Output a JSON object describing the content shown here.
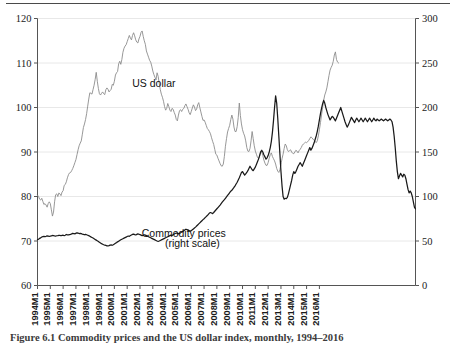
{
  "figure": {
    "caption": "Figure 6.1  Commodity prices and the US dollar index, monthly, 1994–2016",
    "top_rule": true
  },
  "chart_data": {
    "type": "line",
    "title": "",
    "subtitle": "",
    "xlabel": "",
    "ylabel": "",
    "grid": true,
    "grid_color": "#e8e8e8",
    "legend": "inline-annotations",
    "x_tick_labels": [
      "1994M1",
      "1995M1",
      "1996M1",
      "1997M1",
      "1998M1",
      "1999M1",
      "2000M1",
      "2001M1",
      "2002M1",
      "2003M1",
      "2004M1",
      "2005M1",
      "2006M1",
      "2007M1",
      "2008M1",
      "2009M1",
      "2010M1",
      "2011M1",
      "2012M1",
      "2013M1",
      "2014M1",
      "2015M1",
      "2016M1"
    ],
    "x_range": [
      "1994M1",
      "2016M7"
    ],
    "left_axis": {
      "name": "US dollar",
      "ticks": [
        60,
        70,
        80,
        90,
        100,
        110,
        120
      ],
      "ylim": [
        60,
        120
      ],
      "tick_labels": [
        "60",
        "70",
        "80",
        "90",
        "100",
        "110",
        "120"
      ]
    },
    "right_axis": {
      "name": "Commodity prices (right scale)",
      "ticks": [
        0,
        50,
        100,
        150,
        200,
        250,
        300
      ],
      "ylim": [
        0,
        300
      ],
      "tick_labels": [
        "0",
        "50",
        "100",
        "150",
        "200",
        "250",
        "300"
      ]
    },
    "annotations": [
      {
        "text": "US dollar",
        "x_approx": "2003M2",
        "y_left_approx": 104.5
      },
      {
        "text": "Commodity prices",
        "x_approx": "2005M6",
        "y_left_approx": 71.0
      },
      {
        "text": "(right scale)",
        "x_approx": "2006M2",
        "y_left_approx": 68.6
      }
    ],
    "series": [
      {
        "name": "US dollar",
        "axis": "left",
        "color": "#8c8c8c",
        "width": 0.9,
        "values": [
          80.3,
          80.0,
          79.4,
          79.2,
          79.6,
          78.9,
          78.2,
          78.4,
          78.1,
          77.6,
          78.4,
          78.8,
          78.4,
          77.0,
          75.6,
          76.5,
          78.8,
          80.4,
          80.6,
          80.0,
          80.8,
          80.6,
          80.2,
          81.0,
          81.3,
          82.5,
          82.7,
          83.3,
          84.2,
          84.9,
          85.3,
          85.4,
          85.8,
          86.3,
          86.9,
          87.6,
          88.3,
          89.4,
          90.5,
          91.4,
          92.0,
          92.5,
          94.0,
          95.5,
          96.3,
          97.3,
          98.6,
          100.3,
          101.9,
          103.3,
          103.2,
          103.0,
          104.0,
          105.0,
          106.3,
          107.9,
          105.9,
          104.3,
          103.1,
          102.8,
          103.2,
          103.5,
          103.1,
          102.9,
          104.0,
          104.4,
          104.1,
          103.5,
          103.8,
          104.1,
          105.2,
          105.0,
          105.9,
          107.3,
          107.8,
          108.1,
          109.8,
          110.4,
          109.7,
          110.8,
          112.4,
          113.3,
          113.8,
          114.1,
          114.8,
          115.5,
          116.2,
          115.6,
          115.2,
          116.2,
          116.8,
          116.1,
          115.2,
          114.7,
          114.5,
          115.4,
          116.0,
          116.9,
          117.2,
          116.0,
          115.0,
          114.2,
          112.7,
          112.0,
          111.3,
          110.6,
          110.2,
          109.3,
          108.2,
          107.4,
          106.8,
          106.2,
          107.8,
          107.0,
          105.4,
          104.0,
          103.0,
          102.3,
          101.4,
          100.2,
          99.4,
          99.8,
          100.9,
          100.2,
          99.4,
          99.1,
          99.8,
          99.6,
          98.9,
          98.3,
          97.3,
          97.0,
          98.3,
          99.3,
          99.5,
          99.1,
          99.6,
          99.8,
          100.4,
          100.8,
          100.2,
          99.6,
          98.8,
          98.4,
          99.1,
          99.9,
          100.6,
          100.1,
          99.3,
          99.6,
          100.6,
          101.1,
          100.0,
          99.0,
          98.0,
          97.1,
          97.2,
          96.7,
          96.0,
          95.3,
          95.0,
          94.6,
          94.1,
          93.2,
          92.4,
          91.7,
          90.6,
          89.5,
          89.3,
          88.6,
          88.0,
          87.4,
          86.9,
          86.8,
          87.3,
          89.0,
          91.3,
          93.0,
          94.5,
          95.3,
          96.0,
          97.3,
          98.3,
          97.4,
          95.6,
          94.6,
          94.6,
          95.7,
          97.8,
          101.0,
          98.2,
          96.3,
          95.0,
          94.2,
          93.6,
          92.5,
          91.0,
          90.2,
          90.1,
          90.8,
          92.5,
          94.6,
          93.0,
          91.4,
          90.2,
          89.5,
          88.8,
          88.5,
          89.0,
          90.2,
          90.0,
          89.2,
          88.2,
          87.5,
          87.0,
          87.0,
          87.6,
          88.6,
          89.4,
          89.8,
          89.0,
          88.5,
          88.0,
          87.3,
          86.3,
          85.7,
          85.4,
          86.0,
          87.2,
          88.5,
          89.5,
          90.8,
          91.8,
          91.4,
          90.5,
          90.1,
          90.3,
          90.5,
          90.0,
          89.7,
          89.6,
          90.0,
          90.4,
          90.2,
          89.8,
          90.3,
          90.6,
          91.0,
          91.5,
          91.8,
          92.0,
          92.2,
          92.1,
          92.3,
          92.6,
          93.0,
          93.4,
          93.2,
          92.9,
          92.6,
          92.4,
          92.1,
          92.5,
          93.6,
          95.0,
          96.6,
          98.3,
          100.0,
          101.6,
          102.8,
          103.5,
          104.4,
          105.8,
          107.2,
          108.4,
          109.0,
          109.5,
          110.4,
          111.8,
          112.5,
          110.8,
          110.2,
          110.0
        ]
      },
      {
        "name": "Commodity prices",
        "axis": "right",
        "color": "#1a1a1a",
        "width": 1.25,
        "values": [
          51.5,
          52.0,
          53.0,
          53.5,
          54.5,
          55.0,
          55.2,
          55.0,
          55.3,
          55.8,
          55.6,
          55.3,
          55.4,
          55.8,
          56.2,
          56.0,
          55.7,
          55.5,
          55.9,
          56.1,
          56.4,
          56.2,
          55.9,
          56.3,
          56.5,
          56.0,
          56.5,
          57.3,
          57.0,
          56.8,
          57.2,
          57.5,
          58.0,
          58.6,
          58.4,
          58.0,
          58.8,
          59.2,
          58.8,
          58.4,
          58.6,
          58.2,
          57.8,
          57.5,
          57.0,
          57.4,
          57.0,
          56.5,
          56.0,
          55.3,
          54.6,
          54.0,
          53.3,
          52.6,
          51.8,
          51.0,
          50.2,
          49.5,
          48.6,
          47.8,
          47.0,
          46.4,
          45.8,
          45.4,
          45.0,
          44.6,
          44.4,
          44.8,
          45.4,
          45.6,
          45.2,
          45.8,
          46.6,
          47.5,
          48.2,
          49.0,
          49.8,
          50.6,
          51.4,
          52.0,
          52.6,
          53.2,
          53.8,
          54.4,
          55.0,
          55.6,
          55.2,
          56.2,
          56.8,
          57.4,
          57.8,
          57.2,
          56.8,
          57.4,
          58.0,
          57.6,
          57.2,
          56.6,
          56.0,
          56.4,
          57.0,
          56.6,
          56.0,
          55.4,
          54.8,
          54.2,
          53.6,
          53.0,
          52.4,
          51.8,
          51.2,
          50.6,
          50.0,
          49.6,
          50.0,
          50.6,
          51.2,
          51.8,
          52.4,
          53.0,
          53.6,
          54.2,
          54.8,
          55.4,
          56.0,
          56.6,
          56.2,
          57.0,
          57.8,
          58.4,
          59.0,
          58.6,
          58.0,
          58.5,
          59.2,
          60.0,
          60.8,
          61.6,
          62.4,
          63.2,
          62.8,
          62.2,
          61.6,
          61.0,
          61.6,
          62.6,
          63.6,
          64.6,
          65.6,
          66.8,
          68.0,
          69.2,
          70.4,
          71.6,
          72.8,
          74.0,
          75.0,
          76.2,
          77.4,
          78.6,
          80.0,
          81.4,
          82.0,
          81.4,
          80.8,
          82.0,
          83.4,
          84.8,
          86.2,
          87.6,
          89.0,
          90.4,
          92.0,
          93.6,
          95.0,
          96.4,
          98.0,
          99.6,
          101.2,
          102.8,
          104.4,
          106.0,
          107.0,
          108.6,
          110.2,
          112.0,
          114.0,
          116.0,
          118.5,
          121.0,
          124.0,
          127.0,
          128.0,
          126.0,
          124.0,
          125.5,
          127.0,
          129.0,
          131.5,
          134.0,
          132.0,
          130.0,
          129.0,
          131.0,
          133.0,
          136.0,
          139.0,
          142.0,
          146.0,
          150.0,
          152.0,
          150.0,
          147.0,
          144.5,
          142.0,
          143.5,
          146.0,
          150.0,
          155.0,
          162.0,
          172.0,
          185.0,
          200.0,
          213.0,
          205.0,
          188.0,
          168.0,
          148.0,
          128.0,
          112.0,
          100.0,
          97.0,
          98.0,
          97.5,
          99.0,
          103.0,
          108.0,
          113.0,
          118.0,
          124.0,
          128.0,
          126.0,
          128.0,
          131.0,
          134.0,
          136.0,
          138.0,
          136.0,
          134.0,
          137.0,
          140.0,
          143.0,
          146.0,
          149.0,
          152.0,
          155.0,
          152.0,
          154.0,
          157.0,
          160.0,
          164.0,
          168.0,
          173.0,
          179.0,
          186.0,
          193.0,
          199.0,
          204.0,
          208.0,
          205.0,
          200.0,
          196.0,
          192.0,
          189.0,
          186.0,
          188.0,
          190.0,
          189.0,
          187.0,
          185.0,
          188.0,
          191.0,
          194.0,
          197.0,
          200.0,
          196.0,
          192.0,
          188.0,
          184.0,
          181.0,
          178.0,
          180.0,
          183.0,
          186.0,
          189.0,
          187.0,
          185.0,
          183.0,
          186.0,
          188.0,
          186.0,
          184.0,
          186.0,
          188.0,
          186.0,
          184.0,
          186.0,
          188.0,
          186.0,
          184.0,
          186.0,
          188.0,
          186.0,
          184.0,
          186.0,
          188.0,
          186.0,
          185.0,
          187.0,
          186.0,
          185.0,
          186.0,
          187.0,
          186.0,
          185.0,
          186.0,
          187.0,
          186.0,
          185.0,
          186.0,
          187.0,
          186.0,
          184.0,
          178.0,
          168.0,
          155.0,
          140.0,
          128.0,
          120.0,
          123.0,
          126.0,
          124.0,
          122.0,
          125.0,
          124.0,
          120.0,
          114.0,
          108.0,
          104.0,
          106.0,
          104.0,
          100.0,
          94.0,
          88.0,
          86.0
        ]
      }
    ]
  }
}
